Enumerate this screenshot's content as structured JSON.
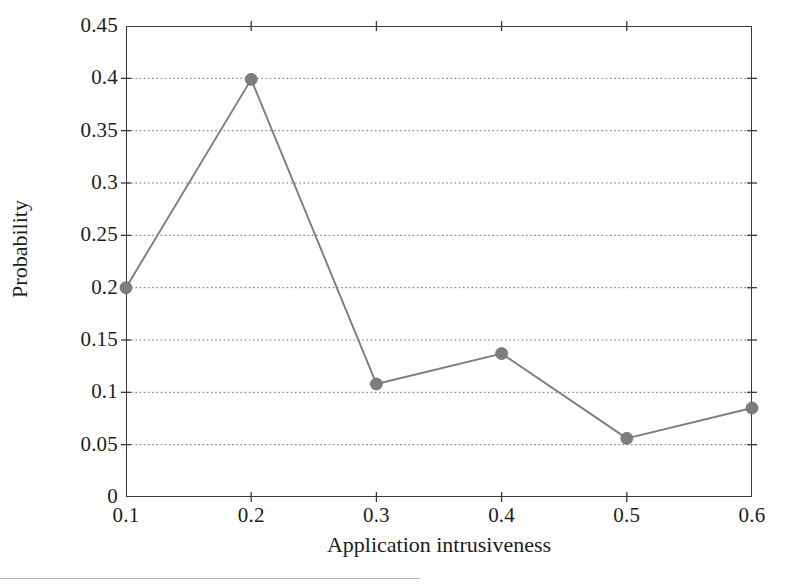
{
  "figure": {
    "background_color": "#ffffff",
    "frame_color": "#3a3a3a",
    "series_color": "#7d7d7d",
    "grid_color": "#6b6b6b",
    "text_color": "#1c1c1c"
  },
  "chart_data": {
    "type": "line",
    "title": "",
    "xlabel": "Application intrusiveness",
    "ylabel": "Probability",
    "x": [
      0.1,
      0.2,
      0.3,
      0.4,
      0.5,
      0.6
    ],
    "values": [
      0.2,
      0.399,
      0.108,
      0.137,
      0.056,
      0.085
    ],
    "series": [
      {
        "name": "Probability",
        "values": [
          0.2,
          0.399,
          0.108,
          0.137,
          0.056,
          0.085
        ]
      }
    ],
    "xlim": [
      0.1,
      0.6
    ],
    "ylim": [
      0,
      0.45
    ],
    "xticks": [
      0.1,
      0.2,
      0.3,
      0.4,
      0.5,
      0.6
    ],
    "xtick_labels": [
      "0.1",
      "0.2",
      "0.3",
      "0.4",
      "0.5",
      "0.6"
    ],
    "yticks": [
      0,
      0.05,
      0.1,
      0.15,
      0.2,
      0.25,
      0.3,
      0.35,
      0.4,
      0.45
    ],
    "ytick_labels": [
      "0",
      "0.05",
      "0.1",
      "0.15",
      "0.2",
      "0.25",
      "0.3",
      "0.35",
      "0.4",
      "0.45"
    ],
    "grid": "horizontal-dotted",
    "legend": "none",
    "marker": "circle",
    "marker_size": 7
  }
}
